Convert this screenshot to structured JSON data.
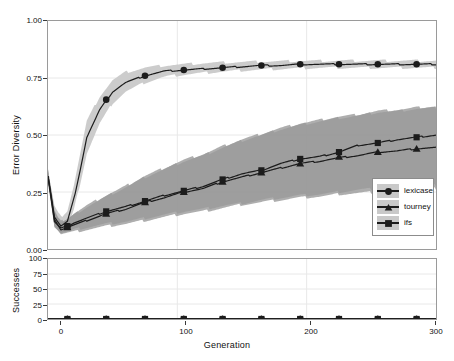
{
  "chart_data": {
    "type": "line",
    "title": "",
    "xlabel": "Generation",
    "panels": [
      {
        "name": "error-diversity-panel",
        "ylabel": "Error Diversity",
        "ylim": [
          0.0,
          1.0
        ],
        "yticks": [
          0.0,
          0.25,
          0.5,
          0.75,
          1.0
        ],
        "ytick_labels": [
          "0.00",
          "0.25",
          "0.50",
          "0.75",
          "1.00"
        ],
        "xlim": [
          0,
          300
        ],
        "xticks": [
          0,
          100,
          200,
          300
        ],
        "xtick_labels": [
          "0",
          "100",
          "200",
          "300"
        ],
        "grid": "faint-gray-major-gridlines",
        "series": [
          {
            "name": "lexicase",
            "marker": "circle",
            "color": "#1c1c1c",
            "band_color": "#c9c9c9",
            "x": [
              0,
              5,
              10,
              15,
              20,
              25,
              30,
              40,
              50,
              60,
              75,
              90,
              105,
              120,
              135,
              150,
              165,
              180,
              195,
              210,
              225,
              240,
              255,
              270,
              285,
              300
            ],
            "values": [
              0.32,
              0.14,
              0.1,
              0.12,
              0.22,
              0.35,
              0.49,
              0.61,
              0.69,
              0.73,
              0.76,
              0.78,
              0.785,
              0.79,
              0.795,
              0.8,
              0.805,
              0.805,
              0.81,
              0.81,
              0.81,
              0.81,
              0.81,
              0.81,
              0.81,
              0.81
            ],
            "band_lower": [
              0.3,
              0.1,
              0.07,
              0.09,
              0.17,
              0.29,
              0.42,
              0.55,
              0.64,
              0.69,
              0.73,
              0.755,
              0.765,
              0.772,
              0.778,
              0.783,
              0.787,
              0.79,
              0.793,
              0.795,
              0.795,
              0.795,
              0.795,
              0.795,
              0.795,
              0.795
            ],
            "band_upper": [
              0.34,
              0.19,
              0.14,
              0.17,
              0.28,
              0.42,
              0.56,
              0.67,
              0.74,
              0.775,
              0.795,
              0.805,
              0.81,
              0.815,
              0.818,
              0.82,
              0.822,
              0.823,
              0.825,
              0.825,
              0.826,
              0.826,
              0.826,
              0.826,
              0.826,
              0.826
            ],
            "marker_x": [
              15,
              45,
              75,
              105,
              135,
              165,
              195,
              225,
              255,
              285
            ],
            "marker_y": [
              0.1,
              0.655,
              0.76,
              0.785,
              0.795,
              0.805,
              0.81,
              0.81,
              0.81,
              0.81
            ]
          },
          {
            "name": "tourney",
            "marker": "triangle",
            "color": "#1c1c1c",
            "band_color": "#9a9a9a",
            "x": [
              0,
              5,
              10,
              15,
              20,
              30,
              45,
              60,
              75,
              90,
              105,
              120,
              135,
              150,
              165,
              180,
              195,
              210,
              225,
              240,
              255,
              270,
              285,
              300
            ],
            "values": [
              0.32,
              0.13,
              0.085,
              0.095,
              0.105,
              0.125,
              0.155,
              0.175,
              0.205,
              0.225,
              0.25,
              0.265,
              0.295,
              0.315,
              0.335,
              0.355,
              0.375,
              0.385,
              0.4,
              0.41,
              0.425,
              0.43,
              0.44,
              0.445
            ],
            "band_lower": [
              0.29,
              0.1,
              0.065,
              0.07,
              0.075,
              0.085,
              0.1,
              0.11,
              0.125,
              0.14,
              0.155,
              0.165,
              0.18,
              0.195,
              0.205,
              0.215,
              0.225,
              0.23,
              0.24,
              0.245,
              0.25,
              0.255,
              0.26,
              0.265
            ],
            "band_upper": [
              0.35,
              0.17,
              0.115,
              0.13,
              0.15,
              0.185,
              0.23,
              0.27,
              0.315,
              0.35,
              0.385,
              0.41,
              0.445,
              0.475,
              0.5,
              0.525,
              0.545,
              0.56,
              0.575,
              0.585,
              0.6,
              0.605,
              0.615,
              0.62
            ],
            "marker_x": [
              15,
              45,
              75,
              105,
              135,
              165,
              195,
              225,
              255,
              285
            ],
            "marker_y": [
              0.095,
              0.155,
              0.205,
              0.25,
              0.295,
              0.335,
              0.375,
              0.405,
              0.425,
              0.44
            ]
          },
          {
            "name": "ifs",
            "marker": "square",
            "color": "#1c1c1c",
            "band_color": "#9a9a9a",
            "x": [
              0,
              5,
              10,
              15,
              20,
              30,
              45,
              60,
              75,
              90,
              105,
              120,
              135,
              150,
              165,
              180,
              195,
              210,
              225,
              240,
              255,
              270,
              285,
              300
            ],
            "values": [
              0.32,
              0.12,
              0.09,
              0.1,
              0.115,
              0.135,
              0.165,
              0.185,
              0.21,
              0.235,
              0.255,
              0.275,
              0.305,
              0.33,
              0.345,
              0.375,
              0.395,
              0.405,
              0.425,
              0.455,
              0.465,
              0.48,
              0.49,
              0.5
            ],
            "band_lower": [
              0.29,
              0.095,
              0.07,
              0.075,
              0.085,
              0.095,
              0.11,
              0.12,
              0.135,
              0.15,
              0.165,
              0.175,
              0.19,
              0.2,
              0.215,
              0.225,
              0.235,
              0.24,
              0.25,
              0.26,
              0.265,
              0.27,
              0.275,
              0.28
            ],
            "band_upper": [
              0.35,
              0.16,
              0.12,
              0.135,
              0.155,
              0.19,
              0.235,
              0.275,
              0.32,
              0.355,
              0.39,
              0.415,
              0.45,
              0.48,
              0.505,
              0.53,
              0.55,
              0.565,
              0.58,
              0.59,
              0.605,
              0.61,
              0.62,
              0.625
            ],
            "marker_x": [
              15,
              45,
              75,
              105,
              135,
              165,
              195,
              225,
              255,
              285
            ],
            "marker_y": [
              0.1,
              0.165,
              0.21,
              0.255,
              0.305,
              0.345,
              0.395,
              0.425,
              0.465,
              0.49
            ]
          }
        ]
      },
      {
        "name": "successes-panel",
        "ylabel": "Successes",
        "ylim": [
          0,
          100
        ],
        "yticks": [
          0,
          25,
          50,
          75,
          100
        ],
        "ytick_labels": [
          "0",
          "25",
          "50",
          "75",
          "100"
        ],
        "xlim": [
          0,
          300
        ],
        "xticks": [
          0,
          100,
          200,
          300
        ],
        "xtick_labels": [
          "0",
          "100",
          "200",
          "300"
        ],
        "grid": "faint-gray-major-gridlines",
        "series": [
          {
            "name": "lexicase",
            "marker": "circle",
            "color": "#1c1c1c",
            "x": [
              0,
              300
            ],
            "values": [
              0,
              0
            ],
            "marker_x": [
              15,
              45,
              75,
              105,
              135,
              165,
              195,
              225,
              255,
              285
            ],
            "marker_y": [
              0,
              0,
              0,
              0,
              0,
              0,
              0,
              0,
              0,
              0
            ]
          },
          {
            "name": "tourney",
            "marker": "triangle",
            "color": "#1c1c1c",
            "x": [
              0,
              300
            ],
            "values": [
              0,
              0
            ],
            "marker_x": [
              15,
              45,
              75,
              105,
              135,
              165,
              195,
              225,
              255,
              285
            ],
            "marker_y": [
              0,
              0,
              0,
              0,
              0,
              0,
              0,
              0,
              0,
              0
            ]
          },
          {
            "name": "ifs",
            "marker": "square",
            "color": "#1c1c1c",
            "x": [
              0,
              300
            ],
            "values": [
              0,
              0
            ],
            "marker_x": [
              15,
              45,
              75,
              105,
              135,
              165,
              195,
              225,
              255,
              285
            ],
            "marker_y": [
              0,
              0,
              0,
              0,
              0,
              0,
              0,
              0,
              0,
              0
            ]
          }
        ]
      }
    ],
    "legend": {
      "position": "inside-right-middle",
      "entries": [
        {
          "label": "lexicase",
          "marker": "circle"
        },
        {
          "label": "tourney",
          "marker": "triangle"
        },
        {
          "label": "ifs",
          "marker": "square"
        }
      ]
    },
    "colors": {
      "line": "#1c1c1c",
      "band_light": "#c9c9c9",
      "band_dark": "#9a9a9a",
      "frame": "#9a9a9a",
      "grid": "#e8e8e8",
      "text": "#111111",
      "legend_key_bg": "#c9c9c9"
    }
  },
  "axes": {
    "top": {
      "ylabel": "Error Diversity",
      "ytick_labels": [
        "1.00",
        "0.75",
        "0.50",
        "0.25",
        "0.00"
      ]
    },
    "bottom": {
      "ylabel": "Successes",
      "ytick_labels": [
        "100",
        "75",
        "50",
        "25",
        "0"
      ]
    },
    "xlabel": "Generation",
    "xtick_labels": [
      "0",
      "100",
      "200",
      "300"
    ]
  },
  "legend": {
    "items": [
      {
        "label": "lexicase"
      },
      {
        "label": "tourney"
      },
      {
        "label": "ifs"
      }
    ]
  }
}
